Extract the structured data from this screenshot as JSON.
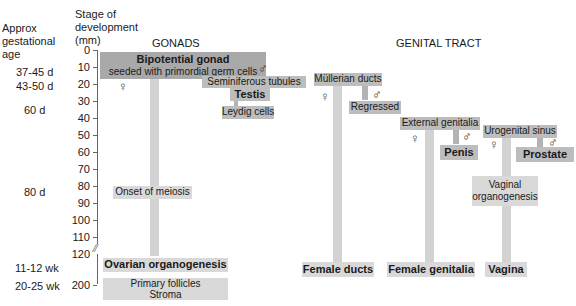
{
  "left_labels": {
    "age_header": [
      "Approx",
      "gestational",
      "age"
    ],
    "stage_header": [
      "Stage of",
      "development",
      "(mm)"
    ],
    "ages": [
      "37-45 d",
      "43-50 d",
      "60 d",
      "80 d",
      "11-12 wk",
      "20-25 wk"
    ]
  },
  "axis": {
    "ticks": [
      "0",
      "10",
      "20",
      "30",
      "40",
      "50",
      "60",
      "70",
      "80",
      "90",
      "100",
      "110",
      "120",
      "200"
    ]
  },
  "gonads": {
    "title": "GONADS",
    "bipotential_title": "Bipotential gonad",
    "bipotential_sub": "seeded with primordial germ cells",
    "female_symbol": "♀",
    "male_symbol": "♂",
    "seminiferous": "Seminiferous tubules",
    "testis": "Testis",
    "leydig": "Leydig cells",
    "meiosis": "Onset of meiosis",
    "ovarian": "Ovarian organogenesis",
    "primary_follicles": "Primary follicles",
    "stroma": "Stroma"
  },
  "genital_tract": {
    "title": "GENITAL TRACT",
    "mullerian": "Müllerian ducts",
    "regressed": "Regressed",
    "external": "External genitalia",
    "penis": "Penis",
    "urogenital": "Urogenital sinus",
    "prostate": "Prostate",
    "vaginal_1": "Vaginal",
    "vaginal_2": "organogenesis",
    "female_ducts": "Female ducts",
    "female_genitalia": "Female genitalia",
    "vagina": "Vagina",
    "female_symbol": "♀",
    "male_symbol": "♂"
  }
}
